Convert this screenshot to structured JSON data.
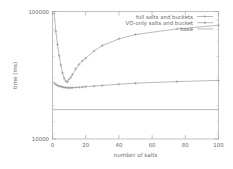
{
  "chart_data": {
    "type": "line",
    "title": "",
    "xlabel": "number of salts",
    "ylabel": "time (ms)",
    "xlim": [
      0,
      100
    ],
    "ylim": [
      10000,
      100000
    ],
    "yscale": "log",
    "grid": false,
    "legend_position": "top-right",
    "xticks": [
      "0",
      "20",
      "40",
      "60",
      "80",
      "100"
    ],
    "xtick_values": [
      0,
      20,
      40,
      60,
      80,
      100
    ],
    "yticks": [
      "10000",
      "100000"
    ],
    "ytick_values": [
      10000,
      100000
    ],
    "series": [
      {
        "name": "full salts and buckets",
        "marker": "plus",
        "x": [
          1,
          2,
          3,
          4,
          5,
          6,
          7,
          8,
          9,
          10,
          11,
          12,
          14,
          16,
          18,
          20,
          25,
          30,
          40,
          50,
          75,
          100
        ],
        "values": [
          97000,
          70000,
          55000,
          45000,
          38000,
          33000,
          30000,
          28500,
          28000,
          29500,
          30500,
          32000,
          35500,
          38500,
          41000,
          43000,
          49000,
          54000,
          61000,
          66000,
          73000,
          78000
        ]
      },
      {
        "name": "VO-only salts and bucket",
        "marker": "plus",
        "x": [
          1,
          2,
          3,
          4,
          5,
          6,
          7,
          8,
          9,
          10,
          11,
          12,
          14,
          16,
          18,
          20,
          25,
          30,
          40,
          50,
          75,
          100
        ],
        "values": [
          27500,
          26800,
          26300,
          26000,
          25800,
          25600,
          25400,
          25300,
          25200,
          25200,
          25200,
          25250,
          25350,
          25450,
          25550,
          25700,
          26000,
          26300,
          26900,
          27400,
          28200,
          28800
        ]
      },
      {
        "name": "base",
        "marker": "none",
        "x": [
          0,
          100
        ],
        "values": [
          17000,
          17000
        ]
      }
    ]
  }
}
